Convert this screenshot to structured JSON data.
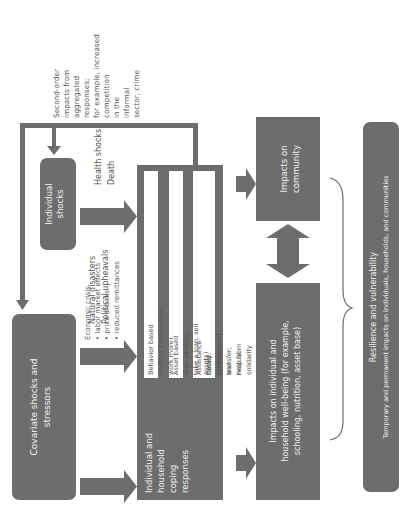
{
  "diagram": {
    "orientation": "rotated-90-ccw",
    "colors": {
      "box_fill": "#6d6d6d",
      "box_text": "#f2f2f2",
      "annotation_text": "#555555",
      "inner_box_fill": "#ffffff",
      "line": "#6d6d6d"
    },
    "nodes": {
      "covariate": {
        "label": "Covariate shocks and stressors"
      },
      "individual": {
        "label": "Individual shocks"
      },
      "coping": {
        "label_lines": [
          "Individual and",
          "household",
          "coping",
          "responses"
        ],
        "behavior": "Behavior based (reduce consumption, work more)",
        "asset": "Asset based (use savings, take a loan, sell assets)",
        "assistance_line1": "Assistance based (government transfer; help from",
        "assistance_line2": "family, relatives, and mutual solidarity networks)"
      },
      "impacts_individual": {
        "line1": "Impacts on individual and",
        "line2": "household well-being (for example,",
        "line3": "schooling, nutrition, asset base)"
      },
      "impacts_community": {
        "line1": "Impacts on",
        "line2": "community"
      },
      "resilience": {
        "title": "Resilience and vulnerability",
        "subtitle": "Temporary and permanent impacts on individuals, households, and communities"
      }
    },
    "annotations": {
      "economic": {
        "line1": "Economic crisis",
        "line2": "• labor market effects",
        "line3": "• price shocks",
        "line4": "• reduced remittances"
      },
      "natural": {
        "line1": "Natural disasters",
        "line2": "Political upheavals"
      },
      "health": {
        "line1": "Health shocks",
        "line2": "Death"
      },
      "second_order": {
        "lines": [
          "Second-order",
          "impacts from",
          "aggregated",
          "responses;",
          "for example, increased",
          "competition",
          "in the",
          "informal",
          "sector, crime"
        ]
      }
    },
    "edges": [
      {
        "from": "covariate",
        "to": "coping",
        "label": "economic"
      },
      {
        "from": "covariate",
        "to": "coping",
        "label": "natural"
      },
      {
        "from": "individual",
        "to": "coping",
        "label": "health"
      },
      {
        "from": "coping",
        "to": "impacts_individual"
      },
      {
        "from": "coping",
        "to": "impacts_community"
      },
      {
        "from": "impacts_individual",
        "to": "impacts_community",
        "bidirectional": true
      },
      {
        "from": "coping",
        "to": "individual",
        "label": "second_order",
        "type": "feedback"
      },
      {
        "from": "coping",
        "to": "covariate",
        "type": "feedback"
      }
    ]
  }
}
